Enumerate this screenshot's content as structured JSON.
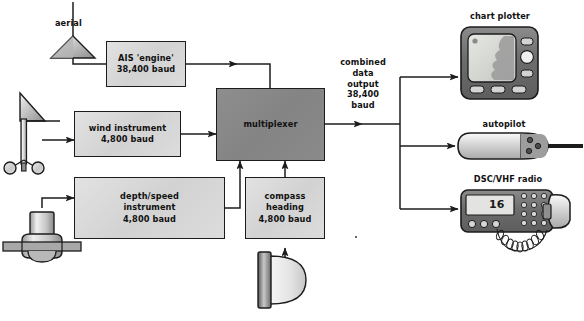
{
  "diagram": {
    "sensors": {
      "aerial_label": "aerial",
      "wind_vane": "wind-vane-sensor",
      "depth_transducer": "depth-transducer-sensor",
      "compass_sensor": "compass-sensor"
    },
    "boxes": [
      {
        "id": "ais",
        "line1": "AIS 'engine'",
        "line2": "38,400 baud"
      },
      {
        "id": "wind",
        "line1": "wind instrument",
        "line2": "4,800 baud"
      },
      {
        "id": "depth",
        "line1": "depth/speed",
        "line2": "instrument",
        "line3": "4,800 baud"
      },
      {
        "id": "compass",
        "line1": "compass",
        "line2": "heading",
        "line3": "4,800 baud"
      }
    ],
    "multiplexer": {
      "label": "multiplexer"
    },
    "output_label": {
      "line1": "combined",
      "line2": "data",
      "line3": "output",
      "line4": "38,400",
      "line5": "baud"
    },
    "devices": [
      {
        "id": "chart_plotter",
        "label": "chart plotter"
      },
      {
        "id": "autopilot",
        "label": "autopilot"
      },
      {
        "id": "radio",
        "label": "DSC/VHF radio",
        "display_value": "16"
      }
    ],
    "colors": {
      "line": "#1c1c1c",
      "light_fill": "#d8d8d8",
      "dark_fill": "#888888",
      "device_body": "#6e6e6e",
      "screen": "#d5d7d4",
      "page_bg": "#ffffff"
    }
  }
}
